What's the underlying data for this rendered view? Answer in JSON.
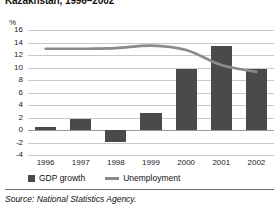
{
  "title": "Kazakhstan, 1996–2002",
  "y_unit": "%",
  "source": "Source:  National Statistics Agency.",
  "legend": {
    "position": "bottom-left",
    "entries": [
      {
        "label": "GDP growth",
        "marker": "bar-swatch",
        "color": "#4a4a4a"
      },
      {
        "label": "Unemployment",
        "marker": "line-swatch",
        "color": "#8a8a8a"
      }
    ]
  },
  "colors": {
    "bar": "#4a4a4a",
    "line": "#8a8a8a",
    "grid": "#c9c9c9",
    "zero_line": "#9a9a9a",
    "text": "#1a1a1a",
    "rule": "#6e6e6e"
  },
  "chart_data": {
    "type": "bar",
    "title": "Kazakhstan, 1996–2002",
    "xlabel": "",
    "ylabel": "%",
    "ylim": [
      -4,
      16
    ],
    "yticks": [
      16,
      14,
      12,
      10,
      8,
      6,
      4,
      2,
      0,
      -2,
      -4
    ],
    "grid": true,
    "categories": [
      "1996",
      "1997",
      "1998",
      "1999",
      "2000",
      "2001",
      "2002"
    ],
    "series": [
      {
        "name": "GDP growth",
        "type": "bar",
        "color": "#4a4a4a",
        "values": [
          0.5,
          1.7,
          -1.9,
          2.7,
          9.8,
          13.5,
          9.8
        ]
      },
      {
        "name": "Unemployment",
        "type": "line",
        "color": "#8a8a8a",
        "values": [
          13.0,
          13.0,
          13.1,
          13.5,
          12.8,
          10.4,
          9.3
        ]
      }
    ]
  }
}
